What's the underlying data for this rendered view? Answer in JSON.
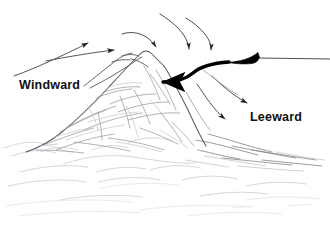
{
  "figure": {
    "type": "line-drawing",
    "background_color": "#ffffff",
    "width": 330,
    "height": 228
  },
  "labels": [
    {
      "id": "windward",
      "text": "Windward",
      "color": "#111111",
      "x": 19,
      "y": 78,
      "font_size": 12.5,
      "bold": true
    },
    {
      "id": "leeward",
      "text": "Leeward",
      "color": "#111111",
      "x": 250,
      "y": 110,
      "font_size": 12.5,
      "bold": true
    }
  ],
  "colors": {
    "ink_dark": "#1a1a1a",
    "ink_sketch": "#6b6b72",
    "ink_faint": "#b9b9c0",
    "ink_very_faint": "#d8d8de",
    "bold_arrow": "#000000",
    "background": "#ffffff"
  },
  "arrows": {
    "windward_thin": [
      {
        "id": "windward-arrow-lower",
        "from": [
          14,
          75
        ],
        "to": [
          90,
          42
        ],
        "style": "thin-straight"
      },
      {
        "id": "windward-arrow-upper",
        "from": [
          45,
          61
        ],
        "to": [
          117,
          50
        ],
        "style": "thin-straight"
      }
    ],
    "crest_thin": [
      {
        "id": "crest-arrow-1",
        "from": [
          124,
          32
        ],
        "to": [
          158,
          50
        ],
        "style": "thin-curved"
      },
      {
        "id": "crest-arrow-2",
        "from": [
          160,
          13
        ],
        "to": [
          189,
          52
        ],
        "style": "thin-curved"
      },
      {
        "id": "crest-arrow-3",
        "from": [
          186,
          17
        ],
        "to": [
          212,
          53
        ],
        "style": "thin-curved"
      }
    ],
    "leeward_thin": [
      {
        "id": "leeward-arrow-upper",
        "from": [
          213,
          75
        ],
        "to": [
          250,
          105
        ],
        "style": "thin-curved"
      },
      {
        "id": "leeward-arrow-lower",
        "from": [
          198,
          83
        ],
        "to": [
          228,
          121
        ],
        "style": "thin-curved"
      }
    ],
    "bold": {
      "id": "bold-descending-airflow-arrow",
      "tail_line_to_edge": [
        330,
        59
      ],
      "wedge_start": [
        258,
        58
      ],
      "wedge_end": [
        222,
        61
      ],
      "curve_through": [
        196,
        64
      ],
      "head_at": [
        154,
        82
      ],
      "color": "#000000",
      "description": "thick tapered arrow descending from right to mountain peak"
    }
  },
  "mountain": {
    "peak_x": 142,
    "peak_y": 52,
    "base_left_x": 24,
    "base_right_x": 300,
    "base_y": 155,
    "description": "central sketched mountain with sub-peak ridge on the left flank"
  },
  "foreground": {
    "description": "faint rolling foreground hills drawn in light pencil strokes",
    "horizon_y": 150
  }
}
